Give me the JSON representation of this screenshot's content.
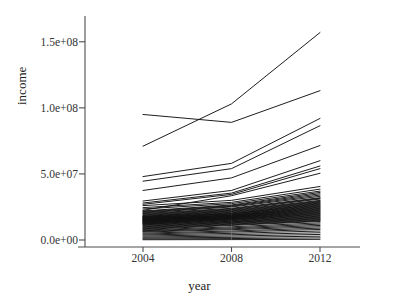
{
  "chart_data": {
    "type": "line",
    "title": "",
    "xlabel": "year",
    "ylabel": "income",
    "x": [
      2004,
      2008,
      2012
    ],
    "xtick_labels": [
      "2004",
      "2008",
      "2012"
    ],
    "ytick_labels": [
      "0.0e+00",
      "5.0e+07",
      "1.0e+08",
      "1.5e+08"
    ],
    "ytick_values": [
      0,
      50000000,
      100000000,
      150000000
    ],
    "xlim": [
      2004,
      2012
    ],
    "ylim": [
      0,
      168000000
    ],
    "grid": false,
    "legend": false,
    "legend_position": "none",
    "line_color": "#111111",
    "axis_color": "#4d4d4d",
    "background": "#ffffff",
    "series_count": 64,
    "series": [
      {
        "name": "s01",
        "values": [
          71000000,
          103000000,
          157000000
        ]
      },
      {
        "name": "s02",
        "values": [
          95000000,
          89000000,
          113000000
        ]
      },
      {
        "name": "s03",
        "values": [
          48000000,
          58000000,
          92000000
        ]
      },
      {
        "name": "s04",
        "values": [
          44500000,
          54000000,
          86500000
        ]
      },
      {
        "name": "s05",
        "values": [
          37500000,
          47000000,
          71500000
        ]
      },
      {
        "name": "s06",
        "values": [
          29500000,
          37500000,
          60000000
        ]
      },
      {
        "name": "s07",
        "values": [
          28000000,
          35500000,
          56000000
        ]
      },
      {
        "name": "s08",
        "values": [
          27000000,
          34500000,
          54000000
        ]
      },
      {
        "name": "s09",
        "values": [
          22500000,
          33500000,
          50500000
        ]
      },
      {
        "name": "s10",
        "values": [
          26000000,
          30000000,
          40500000
        ]
      },
      {
        "name": "s11",
        "values": [
          24500000,
          28500000,
          38500000
        ]
      },
      {
        "name": "s12",
        "values": [
          23500000,
          27500000,
          37000000
        ]
      },
      {
        "name": "s13",
        "values": [
          22000000,
          26500000,
          36000000
        ]
      },
      {
        "name": "s14",
        "values": [
          21500000,
          26000000,
          35000000
        ]
      },
      {
        "name": "s15",
        "values": [
          21000000,
          25500000,
          34000000
        ]
      },
      {
        "name": "s16",
        "values": [
          20500000,
          25000000,
          33000000
        ]
      },
      {
        "name": "s17",
        "values": [
          20000000,
          24000000,
          32000000
        ]
      },
      {
        "name": "s18",
        "values": [
          19500000,
          23500000,
          31500000
        ]
      },
      {
        "name": "s19",
        "values": [
          19000000,
          23000000,
          31000000
        ]
      },
      {
        "name": "s20",
        "values": [
          18500000,
          22500000,
          30000000
        ]
      },
      {
        "name": "s21",
        "values": [
          18000000,
          22000000,
          29500000
        ]
      },
      {
        "name": "s22",
        "values": [
          17800000,
          21500000,
          29000000
        ]
      },
      {
        "name": "s23",
        "values": [
          17500000,
          21000000,
          28500000
        ]
      },
      {
        "name": "s24",
        "values": [
          17200000,
          20500000,
          28000000
        ]
      },
      {
        "name": "s25",
        "values": [
          17000000,
          20000000,
          27500000
        ]
      },
      {
        "name": "s26",
        "values": [
          16800000,
          19800000,
          27000000
        ]
      },
      {
        "name": "s27",
        "values": [
          16500000,
          19500000,
          26500000
        ]
      },
      {
        "name": "s28",
        "values": [
          16200000,
          19000000,
          26000000
        ]
      },
      {
        "name": "s29",
        "values": [
          16000000,
          18800000,
          25500000
        ]
      },
      {
        "name": "s30",
        "values": [
          15800000,
          18500000,
          25000000
        ]
      },
      {
        "name": "s31",
        "values": [
          15500000,
          18200000,
          24500000
        ]
      },
      {
        "name": "s32",
        "values": [
          15200000,
          18000000,
          24000000
        ]
      },
      {
        "name": "s33",
        "values": [
          15000000,
          17800000,
          23500000
        ]
      },
      {
        "name": "s34",
        "values": [
          14800000,
          17500000,
          23000000
        ]
      },
      {
        "name": "s35",
        "values": [
          14500000,
          17200000,
          22500000
        ]
      },
      {
        "name": "s36",
        "values": [
          14200000,
          17000000,
          22000000
        ]
      },
      {
        "name": "s37",
        "values": [
          14000000,
          16800000,
          21500000
        ]
      },
      {
        "name": "s38",
        "values": [
          13700000,
          16500000,
          21000000
        ]
      },
      {
        "name": "s39",
        "values": [
          13400000,
          16200000,
          20500000
        ]
      },
      {
        "name": "s40",
        "values": [
          13100000,
          16000000,
          20000000
        ]
      },
      {
        "name": "s41",
        "values": [
          12800000,
          15700000,
          19500000
        ]
      },
      {
        "name": "s42",
        "values": [
          12500000,
          15400000,
          19000000
        ]
      },
      {
        "name": "s43",
        "values": [
          12200000,
          15000000,
          18500000
        ]
      },
      {
        "name": "s44",
        "values": [
          11900000,
          14600000,
          18000000
        ]
      },
      {
        "name": "s45",
        "values": [
          11500000,
          14200000,
          17500000
        ]
      },
      {
        "name": "s46",
        "values": [
          11000000,
          13800000,
          17000000
        ]
      },
      {
        "name": "s47",
        "values": [
          10500000,
          13400000,
          16500000
        ]
      },
      {
        "name": "s48",
        "values": [
          10000000,
          13000000,
          16000000
        ]
      },
      {
        "name": "s49",
        "values": [
          9500000,
          12500000,
          15500000
        ]
      },
      {
        "name": "s50",
        "values": [
          9000000,
          12000000,
          15000000
        ]
      },
      {
        "name": "s51",
        "values": [
          8500000,
          11500000,
          14500000
        ]
      },
      {
        "name": "s52",
        "values": [
          8000000,
          11000000,
          14000000
        ]
      },
      {
        "name": "s53",
        "values": [
          7500000,
          10000000,
          13000000
        ]
      },
      {
        "name": "s54",
        "values": [
          7000000,
          9200000,
          12000000
        ]
      },
      {
        "name": "s55",
        "values": [
          6500000,
          8500000,
          11000000
        ]
      },
      {
        "name": "s56",
        "values": [
          6000000,
          7800000,
          10000000
        ]
      },
      {
        "name": "s57",
        "values": [
          5200000,
          6800000,
          9000000
        ]
      },
      {
        "name": "s58",
        "values": [
          4500000,
          6000000,
          8000000
        ]
      },
      {
        "name": "s59",
        "values": [
          3800000,
          5000000,
          6800000
        ]
      },
      {
        "name": "s60",
        "values": [
          3000000,
          4000000,
          5500000
        ]
      },
      {
        "name": "s61",
        "values": [
          2200000,
          3000000,
          4200000
        ]
      },
      {
        "name": "s62",
        "values": [
          1500000,
          2000000,
          2900000
        ]
      },
      {
        "name": "s63",
        "values": [
          800000,
          1100000,
          1600000
        ]
      },
      {
        "name": "s64",
        "values": [
          200000,
          300000,
          500000
        ]
      }
    ]
  }
}
